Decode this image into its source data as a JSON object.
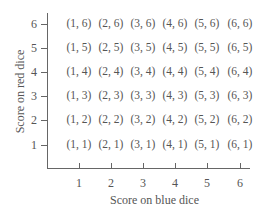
{
  "chart_data": {
    "type": "table",
    "title": "",
    "xlabel": "Score on blue dice",
    "ylabel": "Score on red dice",
    "x_ticks": [
      "1",
      "2",
      "3",
      "4",
      "5",
      "6"
    ],
    "y_ticks": [
      "1",
      "2",
      "3",
      "4",
      "5",
      "6"
    ],
    "rows": [
      [
        "(1, 6)",
        "(2, 6)",
        "(3, 6)",
        "(4, 6)",
        "(5, 6)",
        "(6, 6)"
      ],
      [
        "(1, 5)",
        "(2, 5)",
        "(3, 5)",
        "(4, 5)",
        "(5, 5)",
        "(6, 5)"
      ],
      [
        "(1, 4)",
        "(2, 4)",
        "(3, 4)",
        "(4, 4)",
        "(5, 4)",
        "(6, 4)"
      ],
      [
        "(1, 3)",
        "(2, 3)",
        "(3, 3)",
        "(4, 3)",
        "(5, 3)",
        "(6, 3)"
      ],
      [
        "(1, 2)",
        "(2, 2)",
        "(3, 2)",
        "(4, 2)",
        "(5, 2)",
        "(6, 2)"
      ],
      [
        "(1, 1)",
        "(2, 1)",
        "(3, 1)",
        "(4, 1)",
        "(5, 1)",
        "(6, 1)"
      ]
    ]
  },
  "axis": {
    "xlabel": "Score on blue dice",
    "ylabel": "Score on red dice",
    "x_ticks": [
      "1",
      "2",
      "3",
      "4",
      "5",
      "6"
    ],
    "y_ticks_top_to_bottom": [
      "6",
      "5",
      "4",
      "3",
      "2",
      "1"
    ]
  }
}
